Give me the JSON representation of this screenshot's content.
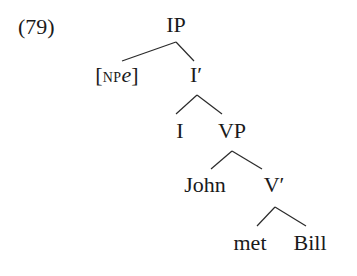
{
  "example_number": "(79)",
  "tree": {
    "nodes": [
      {
        "id": "IP",
        "label": "IP",
        "x": 176,
        "y": 12
      },
      {
        "id": "NPe",
        "label_open": "[",
        "label_sub": "NP",
        "label_main": "e",
        "label_close": "]",
        "x": 117,
        "y": 62
      },
      {
        "id": "Ibar",
        "label": "I′",
        "x": 196,
        "y": 62
      },
      {
        "id": "I",
        "label": "I",
        "x": 180,
        "y": 118
      },
      {
        "id": "VP",
        "label": "VP",
        "x": 232,
        "y": 118
      },
      {
        "id": "John",
        "label": "John",
        "x": 205,
        "y": 172
      },
      {
        "id": "Vbar",
        "label": "V′",
        "x": 274,
        "y": 172
      },
      {
        "id": "met",
        "label": "met",
        "x": 250,
        "y": 230
      },
      {
        "id": "Bill",
        "label": "Bill",
        "x": 310,
        "y": 230
      }
    ],
    "edges": [
      {
        "from": "IP",
        "to": "NPe"
      },
      {
        "from": "IP",
        "to": "Ibar"
      },
      {
        "from": "Ibar",
        "to": "I"
      },
      {
        "from": "Ibar",
        "to": "VP"
      },
      {
        "from": "VP",
        "to": "John"
      },
      {
        "from": "VP",
        "to": "Vbar"
      },
      {
        "from": "Vbar",
        "to": "met"
      },
      {
        "from": "Vbar",
        "to": "Bill"
      }
    ]
  }
}
